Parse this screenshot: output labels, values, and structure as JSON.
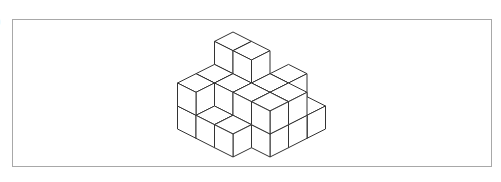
{
  "figure": {
    "edge_glyph": ")",
    "stroke_color": "#333333",
    "face_color": "#ffffff",
    "frame_color": "#a8a8a8",
    "projection": {
      "origin_x": 251.5,
      "origin_y": 91.7,
      "u": 18.5,
      "v": 9.33,
      "h": 23
    },
    "heightmap_rows_y_by_x": [
      [
        0,
        0,
        2,
        1
      ],
      [
        3,
        3,
        2,
        2
      ],
      [
        2,
        2,
        2,
        2
      ],
      [
        2,
        1,
        1,
        0
      ]
    ],
    "cube_count": 25
  }
}
